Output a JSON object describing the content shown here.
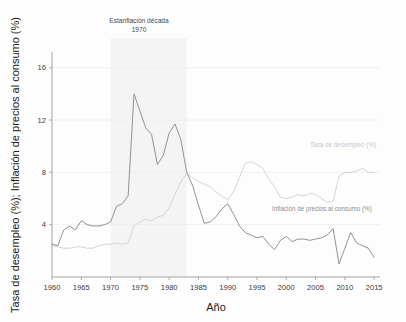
{
  "chart_data": {
    "type": "line",
    "title": "",
    "xlabel": "Año",
    "ylabel": "Tasa de desempleo (%); Inflación de precios al consumo (%)",
    "xlim": [
      1960,
      2016
    ],
    "ylim": [
      0,
      17.2
    ],
    "xticks": [
      1960,
      1965,
      1970,
      1975,
      1980,
      1985,
      1990,
      1995,
      2000,
      2005,
      2010,
      2015
    ],
    "yticks": [
      4,
      8,
      12,
      16
    ],
    "grid": true,
    "legend_position": "inline-right",
    "annotations": [
      {
        "name": "stagflation-annotation",
        "line1": "Estanflación década",
        "line2": "1970",
        "x_span": [
          1970,
          1983
        ]
      }
    ],
    "x": [
      1960,
      1961,
      1962,
      1963,
      1964,
      1965,
      1966,
      1967,
      1968,
      1969,
      1970,
      1971,
      1972,
      1973,
      1974,
      1975,
      1976,
      1977,
      1978,
      1979,
      1980,
      1981,
      1982,
      1983,
      1984,
      1985,
      1986,
      1987,
      1988,
      1989,
      1990,
      1991,
      1992,
      1993,
      1994,
      1995,
      1996,
      1997,
      1998,
      1999,
      2000,
      2001,
      2002,
      2003,
      2004,
      2005,
      2006,
      2007,
      2008,
      2009,
      2010,
      2011,
      2012,
      2013,
      2014,
      2015
    ],
    "series": [
      {
        "name": "Inflación de precios al consumo (%)",
        "color": "#8d8d8d",
        "label": "Inflación de precios al consumo (%)",
        "values": [
          2.5,
          2.4,
          3.6,
          3.9,
          3.6,
          4.3,
          4.0,
          3.9,
          3.9,
          4.0,
          4.2,
          5.4,
          5.6,
          6.2,
          14.0,
          12.7,
          11.4,
          10.9,
          8.6,
          9.3,
          11.0,
          11.7,
          10.5,
          8.0,
          7.0,
          5.5,
          4.1,
          4.2,
          4.6,
          5.2,
          5.6,
          4.8,
          3.9,
          3.4,
          3.2,
          3.0,
          3.1,
          2.5,
          2.1,
          2.8,
          3.1,
          2.7,
          2.9,
          2.9,
          2.8,
          2.9,
          3.0,
          3.2,
          3.7,
          1.0,
          2.2,
          3.4,
          2.6,
          2.4,
          2.2,
          1.5
        ]
      },
      {
        "name": "Tasa de desempleo (%)",
        "color": "#d2d2d2",
        "label": "Tasa de desempleo (%)",
        "values": [
          2.4,
          2.3,
          2.2,
          2.2,
          2.3,
          2.3,
          2.2,
          2.2,
          2.4,
          2.5,
          2.5,
          2.6,
          2.5,
          2.6,
          3.9,
          4.2,
          4.4,
          4.3,
          4.6,
          4.7,
          5.3,
          6.3,
          7.3,
          7.9,
          7.6,
          7.3,
          7.1,
          6.9,
          6.5,
          6.2,
          5.9,
          6.5,
          7.6,
          8.7,
          8.8,
          8.6,
          8.3,
          7.5,
          6.9,
          6.1,
          6.0,
          6.1,
          6.3,
          6.2,
          6.4,
          6.3,
          6.0,
          5.7,
          5.8,
          7.7,
          8.0,
          8.0,
          8.1,
          8.3,
          8.0,
          8.0
        ]
      }
    ]
  }
}
